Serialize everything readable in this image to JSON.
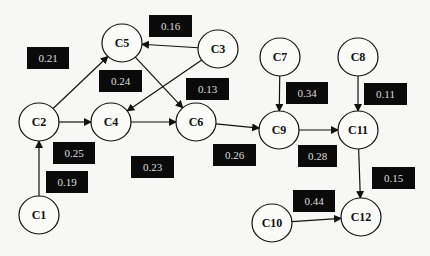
{
  "diagram": {
    "type": "directed weighted graph",
    "nodes": [
      {
        "id": "C1",
        "label": "C1",
        "x": 39,
        "y": 215
      },
      {
        "id": "C2",
        "label": "C2",
        "x": 39,
        "y": 122
      },
      {
        "id": "C3",
        "label": "C3",
        "x": 218,
        "y": 49
      },
      {
        "id": "C4",
        "label": "C4",
        "x": 111,
        "y": 122
      },
      {
        "id": "C5",
        "label": "C5",
        "x": 122,
        "y": 43
      },
      {
        "id": "C6",
        "label": "C6",
        "x": 196,
        "y": 122
      },
      {
        "id": "C7",
        "label": "C7",
        "x": 280,
        "y": 57
      },
      {
        "id": "C8",
        "label": "C8",
        "x": 358,
        "y": 57
      },
      {
        "id": "C9",
        "label": "C9",
        "x": 279,
        "y": 130
      },
      {
        "id": "C10",
        "label": "C10",
        "x": 272,
        "y": 223
      },
      {
        "id": "C11",
        "label": "C11",
        "x": 358,
        "y": 130
      },
      {
        "id": "C12",
        "label": "C12",
        "x": 361,
        "y": 217
      }
    ],
    "edges": [
      {
        "from": "C1",
        "to": "C2"
      },
      {
        "from": "C2",
        "to": "C5"
      },
      {
        "from": "C2",
        "to": "C4"
      },
      {
        "from": "C3",
        "to": "C5"
      },
      {
        "from": "C3",
        "to": "C4"
      },
      {
        "from": "C5",
        "to": "C6"
      },
      {
        "from": "C4",
        "to": "C6"
      },
      {
        "from": "C6",
        "to": "C9"
      },
      {
        "from": "C7",
        "to": "C9"
      },
      {
        "from": "C9",
        "to": "C11"
      },
      {
        "from": "C8",
        "to": "C11"
      },
      {
        "from": "C11",
        "to": "C12"
      },
      {
        "from": "C10",
        "to": "C12"
      }
    ],
    "weights": [
      {
        "text": "0.21",
        "x": 27,
        "y": 47,
        "w": 42,
        "h": 22
      },
      {
        "text": "0.16",
        "x": 149,
        "y": 15,
        "w": 43,
        "h": 22
      },
      {
        "text": "0.24",
        "x": 99,
        "y": 70,
        "w": 43,
        "h": 22
      },
      {
        "text": "0.13",
        "x": 186,
        "y": 78,
        "w": 43,
        "h": 22
      },
      {
        "text": "0.25",
        "x": 53,
        "y": 142,
        "w": 42,
        "h": 22
      },
      {
        "text": "0.19",
        "x": 46,
        "y": 171,
        "w": 42,
        "h": 22
      },
      {
        "text": "0.23",
        "x": 131,
        "y": 156,
        "w": 43,
        "h": 22
      },
      {
        "text": "0.34",
        "x": 286,
        "y": 82,
        "w": 42,
        "h": 22
      },
      {
        "text": "0.11",
        "x": 364,
        "y": 83,
        "w": 43,
        "h": 22
      },
      {
        "text": "0.26",
        "x": 213,
        "y": 144,
        "w": 43,
        "h": 22
      },
      {
        "text": "0.28",
        "x": 298,
        "y": 145,
        "w": 39,
        "h": 22
      },
      {
        "text": "0.15",
        "x": 372,
        "y": 167,
        "w": 43,
        "h": 22
      },
      {
        "text": "0.44",
        "x": 293,
        "y": 190,
        "w": 42,
        "h": 22
      }
    ]
  }
}
